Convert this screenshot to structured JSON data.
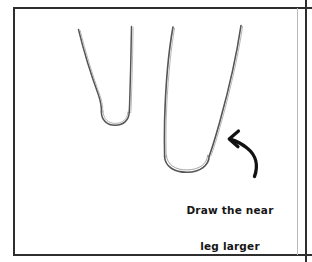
{
  "panel": {
    "name": "drawing-tutorial-panel",
    "background_color": "#ffffff",
    "border_color": "#2e2e2e"
  },
  "caption": {
    "line1": "Draw the near",
    "line2": "leg larger",
    "color": "#161616"
  },
  "annotations": {
    "arrow_label": "curved-arrow-pointing-to-near-leg"
  },
  "drawing": {
    "stroke_color": "#4a4a4a",
    "figures": [
      {
        "name": "far-leg",
        "description": "narrow tapering leg, far side"
      },
      {
        "name": "near-leg",
        "description": "wider tapering leg, near side"
      }
    ]
  }
}
